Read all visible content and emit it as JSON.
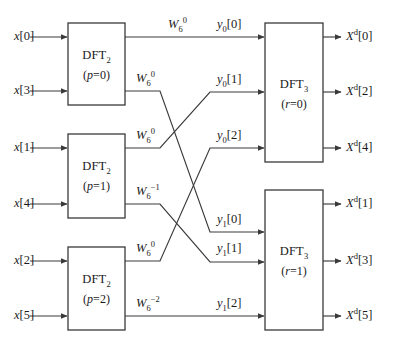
{
  "diagram": {
    "name": "six-point-dft-decomposition-flow-graph",
    "type": "signal-flow-graph",
    "canvas": {
      "width": 398,
      "height": 346,
      "background": "#ffffff"
    },
    "line_color": "#3a3a3a",
    "text_color": "#1a1a1a",
    "inputs": [
      {
        "id": "x0",
        "label_html": "<i>x</i><span class=\"br\">[0]</span>",
        "text": "x[0]",
        "x": 52,
        "y": 37,
        "arrow_from": 30,
        "arrow_to": 68
      },
      {
        "id": "x3",
        "label_html": "<i>x</i><span class=\"br\">[3]</span>",
        "text": "x[3]",
        "x": 52,
        "y": 91,
        "arrow_from": 30,
        "arrow_to": 68
      },
      {
        "id": "x1",
        "label_html": "<i>x</i><span class=\"br\">[1]</span>",
        "text": "x[1]",
        "x": 52,
        "y": 148,
        "arrow_from": 30,
        "arrow_to": 68
      },
      {
        "id": "x4",
        "label_html": "<i>x</i><span class=\"br\">[4]</span>",
        "text": "x[4]",
        "x": 52,
        "y": 204,
        "arrow_from": 30,
        "arrow_to": 68
      },
      {
        "id": "x2",
        "label_html": "<i>x</i><span class=\"br\">[2]</span>",
        "text": "x[2]",
        "x": 52,
        "y": 261,
        "arrow_from": 30,
        "arrow_to": 68
      },
      {
        "id": "x5",
        "label_html": "<i>x</i><span class=\"br\">[5]</span>",
        "text": "x[5]",
        "x": 52,
        "y": 316,
        "arrow_from": 30,
        "arrow_to": 68
      }
    ],
    "outputs": [
      {
        "id": "Xd0",
        "label_html": "<i>X</i><sup>d</sup><span class=\"br\">[0]</span>",
        "text": "X^d[0]",
        "x": 344,
        "y": 37,
        "arrow_from": 323,
        "arrow_to": 340
      },
      {
        "id": "Xd2",
        "label_html": "<i>X</i><sup>d</sup><span class=\"br\">[2]</span>",
        "text": "X^d[2]",
        "x": 344,
        "y": 92,
        "arrow_from": 323,
        "arrow_to": 340
      },
      {
        "id": "Xd4",
        "label_html": "<i>X</i><sup>d</sup><span class=\"br\">[4]</span>",
        "text": "X^d[4]",
        "x": 344,
        "y": 148,
        "arrow_from": 323,
        "arrow_to": 340
      },
      {
        "id": "Xd1",
        "label_html": "<i>X</i><sup>d</sup><span class=\"br\">[1]</span>",
        "text": "X^d[1]",
        "x": 344,
        "y": 204,
        "arrow_from": 323,
        "arrow_to": 340
      },
      {
        "id": "Xd3",
        "label_html": "<i>X</i><sup>d</sup><span class=\"br\">[3]</span>",
        "text": "X^d[3]",
        "x": 344,
        "y": 261,
        "arrow_from": 323,
        "arrow_to": 340
      },
      {
        "id": "Xd5",
        "label_html": "<i>X</i><sup>d</sup><span class=\"br\">[5]</span>",
        "text": "X^d[5]",
        "x": 344,
        "y": 316,
        "arrow_from": 323,
        "arrow_to": 340
      }
    ],
    "stage1_boxes": [
      {
        "id": "dft2-p0",
        "title_html": "DFT<sub>2</sub>",
        "title_text": "DFT2",
        "param_html": "(<i>p</i>=0)",
        "param_text": "(p=0)",
        "x": 68,
        "y": 23,
        "w": 57,
        "h": 82
      },
      {
        "id": "dft2-p1",
        "title_html": "DFT<sub>2</sub>",
        "title_text": "DFT2",
        "param_html": "(<i>p</i>=1)",
        "param_text": "(p=1)",
        "x": 68,
        "y": 134,
        "w": 57,
        "h": 84
      },
      {
        "id": "dft2-p2",
        "title_html": "DFT<sub>2</sub>",
        "title_text": "DFT2",
        "param_html": "(<i>p</i>=2)",
        "param_text": "(p=2)",
        "x": 68,
        "y": 247,
        "w": 57,
        "h": 83
      }
    ],
    "stage2_boxes": [
      {
        "id": "dft3-r0",
        "title_html": "DFT<sub>3</sub>",
        "title_text": "DFT3",
        "param_html": "(<i>r</i>=0)",
        "param_text": "(r=0)",
        "x": 265,
        "y": 23,
        "w": 58,
        "h": 139
      },
      {
        "id": "dft3-r1",
        "title_html": "DFT<sub>3</sub>",
        "title_text": "DFT3",
        "param_html": "(<i>r</i>=1)",
        "param_text": "(r=1)",
        "x": 265,
        "y": 190,
        "w": 58,
        "h": 140
      }
    ],
    "twiddles": [
      {
        "id": "w-a",
        "label_html": "<i>W</i><sub>6</sub><sup>0</sup>",
        "text": "W_6^0",
        "x": 168,
        "y": 24
      },
      {
        "id": "w-b",
        "label_html": "<i>W</i><sub>6</sub><sup>0</sup>",
        "text": "W_6^0",
        "x": 136,
        "y": 78
      },
      {
        "id": "w-c",
        "label_html": "<i>W</i><sub>6</sub><sup>0</sup>",
        "text": "W_6^0",
        "x": 136,
        "y": 135
      },
      {
        "id": "w-d",
        "label_html": "<i>W</i><sub>6</sub><sup>&minus;1</sup>",
        "text": "W_6^-1",
        "x": 136,
        "y": 191
      },
      {
        "id": "w-e",
        "label_html": "<i>W</i><sub>6</sub><sup>0</sup>",
        "text": "W_6^0",
        "x": 136,
        "y": 248
      },
      {
        "id": "w-f",
        "label_html": "<i>W</i><sub>6</sub><sup>&minus;2</sup>",
        "text": "W_6^-2",
        "x": 136,
        "y": 303
      }
    ],
    "intermediate_labels": [
      {
        "id": "y00",
        "label_html": "<i>y</i><sub>0</sub><span class=\"br\">[0]</span>",
        "text": "y_0[0]",
        "x": 217,
        "y": 24
      },
      {
        "id": "y01",
        "label_html": "<i>y</i><sub>0</sub><span class=\"br\">[1]</span>",
        "text": "y_0[1]",
        "x": 217,
        "y": 79
      },
      {
        "id": "y02",
        "label_html": "<i>y</i><sub>0</sub><span class=\"br\">[2]</span>",
        "text": "y_0[2]",
        "x": 217,
        "y": 135
      },
      {
        "id": "y10",
        "label_html": "<i>y</i><sub>1</sub><span class=\"br\">[0]</span>",
        "text": "y_1[0]",
        "x": 217,
        "y": 219
      },
      {
        "id": "y11",
        "label_html": "<i>y</i><sub>1</sub><span class=\"br\">[1]</span>",
        "text": "y_1[1]",
        "x": 217,
        "y": 248
      },
      {
        "id": "y12",
        "label_html": "<i>y</i><sub>1</sub><span class=\"br\">[2]</span>",
        "text": "y_1[2]",
        "x": 217,
        "y": 303
      }
    ],
    "connections": [
      {
        "id": "c-p0-out0-to-y00",
        "from": "dft2-p0.out0",
        "to": "dft3-r0.in0",
        "twiddle": "W_6^0",
        "routing": "straight",
        "points": "125,37 265,37"
      },
      {
        "id": "c-p0-out1-to-y10",
        "from": "dft2-p0.out1",
        "to": "dft3-r1.in0",
        "twiddle": "W_6^0",
        "routing": "diagonal-down",
        "points": "125,91 160,91 210,232 265,232"
      },
      {
        "id": "c-p1-out0-to-y01",
        "from": "dft2-p1.out0",
        "to": "dft3-r0.in1",
        "twiddle": "W_6^0",
        "routing": "diagonal-up",
        "points": "125,148 160,148 210,92 265,92"
      },
      {
        "id": "c-p1-out1-to-y11",
        "from": "dft2-p1.out1",
        "to": "dft3-r1.in1",
        "twiddle": "W_6^-1",
        "routing": "diagonal-down",
        "points": "125,204 160,204 210,262 265,262"
      },
      {
        "id": "c-p2-out0-to-y02",
        "from": "dft2-p2.out0",
        "to": "dft3-r0.in2",
        "twiddle": "W_6^0",
        "routing": "diagonal-up",
        "points": "125,261 160,261 210,148 265,148"
      },
      {
        "id": "c-p2-out1-to-y12",
        "from": "dft2-p2.out1",
        "to": "dft3-r1.in2",
        "twiddle": "W_6^-2",
        "routing": "straight",
        "points": "125,316 265,316"
      }
    ]
  }
}
